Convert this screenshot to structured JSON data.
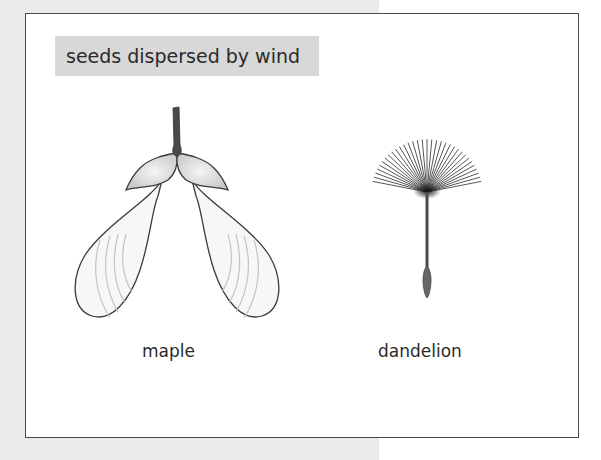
{
  "title": "seeds dispersed by wind",
  "seeds": [
    {
      "name": "maple",
      "label": "maple"
    },
    {
      "name": "dandelion",
      "label": "dandelion"
    }
  ],
  "colors": {
    "outer_background": "#ebebeb",
    "frame_border": "#4a4a4a",
    "title_background": "#d8d8d8",
    "text": "#2a2a2a",
    "stem": "#4a4a4a"
  }
}
